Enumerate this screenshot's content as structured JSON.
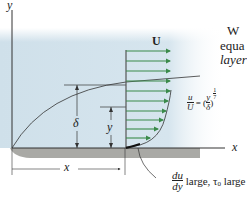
{
  "figure": {
    "axes": {
      "y_label": "y",
      "x_label": "x"
    },
    "free_stream_label": "U",
    "boundary_thickness_label": "δ",
    "height_label": "y",
    "distance_label": "x",
    "profile_equation": {
      "lhs_num": "u",
      "lhs_den": "U",
      "eq": "= (",
      "frac_num": "y",
      "frac_den": "δ",
      "close": ")",
      "exp_num": "1",
      "exp_den": "7"
    },
    "wall_annotation": {
      "num": "du",
      "den": "dy",
      "text": "large, τ",
      "sub": "0",
      "text2": " large"
    },
    "colors": {
      "fluid": "#cfe0ea",
      "arrow": "#3a8a4a",
      "plate": "#a9a9a5",
      "line": "#333333"
    },
    "arrow_count": 12
  },
  "side_text": {
    "line1": "W",
    "line2": "equa",
    "line3": "layer"
  }
}
